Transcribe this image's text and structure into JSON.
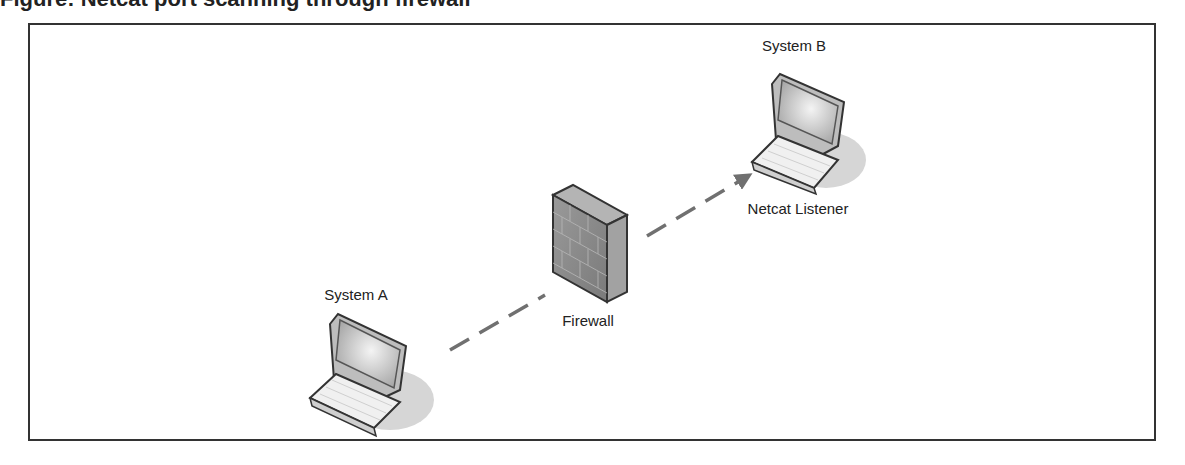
{
  "caption": "Figure: Netcat port scanning through firewall",
  "nodes": {
    "system_a": {
      "label": "System A",
      "icon": "laptop-icon"
    },
    "system_b": {
      "label": "System B",
      "sublabel": "Netcat Listener",
      "icon": "laptop-icon"
    },
    "firewall": {
      "label": "Firewall",
      "icon": "firewall-icon"
    }
  },
  "edges": [
    {
      "from": "system_a",
      "to": "firewall",
      "style": "dashed"
    },
    {
      "from": "firewall",
      "to": "system_b",
      "style": "dashed-arrow"
    }
  ],
  "colors": {
    "border": "#333333",
    "line": "#707070",
    "firewall": "#8a8a8a",
    "screen": "#bdbdbd",
    "shadow": "#d6d6d6"
  }
}
